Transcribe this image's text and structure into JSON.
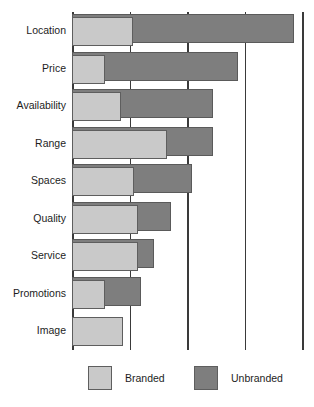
{
  "chart_data": {
    "type": "bar",
    "orientation": "horizontal",
    "title": "",
    "subtitle": "",
    "xlabel": "",
    "ylabel": "",
    "xlim": [
      0,
      4
    ],
    "grid": true,
    "gridlines": [
      0,
      1,
      2,
      3,
      4
    ],
    "legend_position": "bottom",
    "categories": [
      "Location",
      "Price",
      "Availability",
      "Range",
      "Spaces",
      "Quality",
      "Service",
      "Promotions",
      "Image"
    ],
    "series": [
      {
        "name": "Branded",
        "color": "#c9c9c9",
        "values": [
          1.06,
          0.58,
          0.85,
          1.65,
          1.08,
          1.15,
          1.15,
          0.58,
          0.88
        ]
      },
      {
        "name": "Unbranded",
        "color": "#7e7e7e",
        "values": [
          3.86,
          2.89,
          2.46,
          2.46,
          2.09,
          1.73,
          1.42,
          1.2,
          0.0
        ]
      }
    ]
  },
  "legend": {
    "items": [
      {
        "label": "Branded",
        "swatch": "branded-swatch"
      },
      {
        "label": "Unbranded",
        "swatch": "unbranded-swatch"
      }
    ]
  },
  "colors": {
    "branded": "#c9c9c9",
    "unbranded": "#7e7e7e",
    "axis": "#3a3a3a",
    "border": "#5a5a5a",
    "background": "#ffffff",
    "text": "#1d1d1d"
  }
}
